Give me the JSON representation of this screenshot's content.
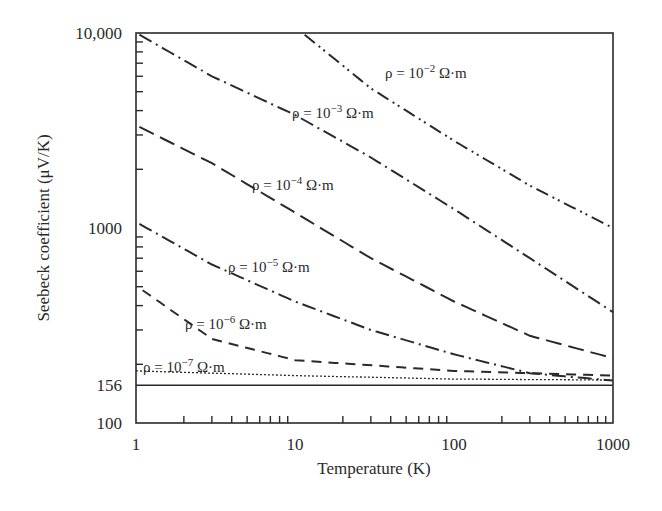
{
  "chart_data": {
    "type": "line",
    "title": "",
    "xlabel": "Temperature (K)",
    "ylabel": "Seebeck coefficient (μV/K)",
    "xscale": "log",
    "yscale": "log",
    "xlim": [
      1,
      1000
    ],
    "ylim": [
      100,
      10000
    ],
    "x_ticks": [
      1,
      10,
      100,
      1000
    ],
    "x_tick_labels": [
      "1",
      "10",
      "100",
      "1000"
    ],
    "y_ticks": [
      100,
      156,
      1000,
      10000
    ],
    "y_tick_labels": [
      "100",
      "156",
      "1000",
      "10,000"
    ],
    "grid": false,
    "legend": "inline labels",
    "series": [
      {
        "name": "ρ = 10⁻² Ω·m",
        "style": "dash-dot-dot",
        "x": [
          11.5,
          30,
          100,
          300,
          1000
        ],
        "y": [
          9800,
          5200,
          2800,
          1650,
          1000
        ]
      },
      {
        "name": "ρ = 10⁻³ Ω·m",
        "style": "dash-dot",
        "x": [
          1.05,
          3,
          10,
          30,
          100,
          300,
          1000
        ],
        "y": [
          9800,
          6000,
          3800,
          2300,
          1250,
          700,
          370
        ]
      },
      {
        "name": "ρ = 10⁻⁴ Ω·m",
        "style": "long-dash",
        "x": [
          1.05,
          3,
          10,
          30,
          100,
          300,
          1000
        ],
        "y": [
          3300,
          2150,
          1200,
          700,
          420,
          280,
          215
        ]
      },
      {
        "name": "ρ = 10⁻⁵ Ω·m",
        "style": "dash-dot",
        "x": [
          1.05,
          3,
          10,
          30,
          100,
          300,
          1000
        ],
        "y": [
          1050,
          650,
          420,
          300,
          225,
          180,
          165
        ]
      },
      {
        "name": "ρ = 10⁻⁶ Ω·m",
        "style": "dash",
        "x": [
          1.1,
          3,
          10,
          100,
          1000
        ],
        "y": [
          480,
          270,
          210,
          185,
          175
        ]
      },
      {
        "name": "ρ = 10⁻⁷ Ω·m",
        "style": "dotted",
        "x": [
          1,
          10,
          100,
          1000
        ],
        "y": [
          185,
          175,
          168,
          166
        ]
      },
      {
        "name": "limit 156 μV/K",
        "style": "solid",
        "x": [
          1,
          1000
        ],
        "y": [
          156,
          156
        ]
      }
    ],
    "annotations": [
      {
        "text_base": "ρ = 10",
        "exp": "−2",
        "unit": " Ω·m",
        "x": 385,
        "y": 78
      },
      {
        "text_base": "ρ = 10",
        "exp": "−3",
        "unit": " Ω·m",
        "x": 292,
        "y": 118
      },
      {
        "text_base": "ρ = 10",
        "exp": "−4",
        "unit": " Ω·m",
        "x": 252,
        "y": 190
      },
      {
        "text_base": "ρ = 10",
        "exp": "−5",
        "unit": " Ω·m",
        "x": 228,
        "y": 272
      },
      {
        "text_base": "ρ = 10",
        "exp": "−6",
        "unit": " Ω·m",
        "x": 185,
        "y": 329
      },
      {
        "text_base": "ρ = 10",
        "exp": "−7",
        "unit": " Ω·m",
        "x": 143,
        "y": 372
      }
    ]
  }
}
